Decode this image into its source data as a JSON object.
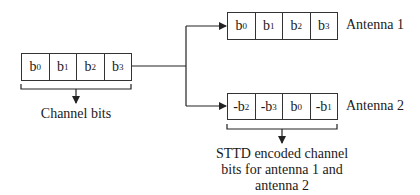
{
  "input": {
    "cells": [
      {
        "base": "b",
        "sub": "0"
      },
      {
        "base": "b",
        "sub": "1"
      },
      {
        "base": "b",
        "sub": "2"
      },
      {
        "base": "b",
        "sub": "3"
      }
    ],
    "caption": "Channel bits"
  },
  "antenna1": {
    "label": "Antenna 1",
    "cells": [
      {
        "base": "b",
        "sub": "0"
      },
      {
        "base": "b",
        "sub": "1"
      },
      {
        "base": "b",
        "sub": "2"
      },
      {
        "base": "b",
        "sub": "3"
      }
    ]
  },
  "antenna2": {
    "label": "Antenna 2",
    "cells": [
      {
        "base": "-b",
        "sub": "2"
      },
      {
        "base": "-b",
        "sub": "3"
      },
      {
        "base": "b",
        "sub": "0"
      },
      {
        "base": "-b",
        "sub": "1"
      }
    ]
  },
  "output_caption": {
    "line1": "STTD encoded channel",
    "line2": "bits for antenna 1 and",
    "line3": "antenna 2"
  },
  "colors": {
    "line": "#222222",
    "box_border": "#333333",
    "text": "#1a1a1a"
  }
}
